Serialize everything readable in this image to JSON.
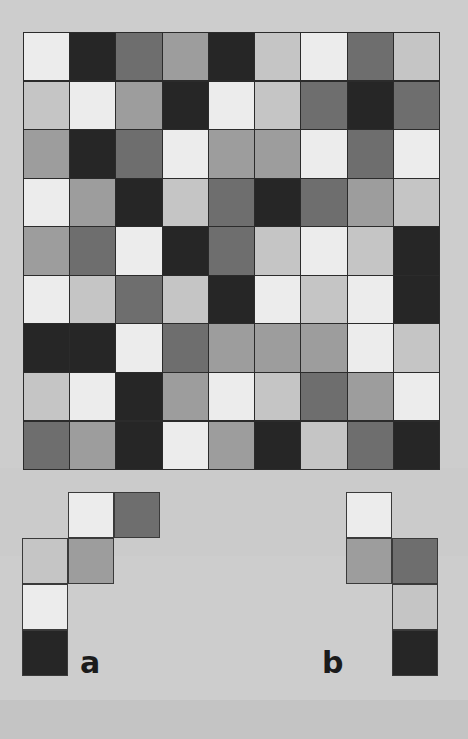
{
  "figure": {
    "background_color": "#cdcdcd",
    "border_color": "#2b2b2b"
  },
  "palette": {
    "very_light": "#ececec",
    "light": "#c5c5c5",
    "medium": "#9d9d9d",
    "medium_dark": "#6e6e6e",
    "very_dark": "#262626"
  },
  "grid": {
    "name": "main-grid",
    "rows": 9,
    "columns": 9,
    "cell_width_px": 46,
    "cell_height_px": 48,
    "cells": [
      [
        "very_light",
        "very_dark",
        "medium_dark",
        "medium",
        "very_dark",
        "light",
        "very_light",
        "medium_dark",
        "light"
      ],
      [
        "light",
        "very_light",
        "medium",
        "very_dark",
        "very_light",
        "light",
        "medium_dark",
        "very_dark",
        "medium_dark"
      ],
      [
        "medium",
        "very_dark",
        "medium_dark",
        "very_light",
        "medium",
        "medium",
        "very_light",
        "medium_dark",
        "very_light"
      ],
      [
        "very_light",
        "medium",
        "very_dark",
        "light",
        "medium_dark",
        "very_dark",
        "medium_dark",
        "medium",
        "light"
      ],
      [
        "medium",
        "medium_dark",
        "very_light",
        "very_dark",
        "medium_dark",
        "light",
        "very_light",
        "light",
        "very_dark"
      ],
      [
        "very_light",
        "light",
        "medium_dark",
        "light",
        "very_dark",
        "very_light",
        "light",
        "very_light",
        "very_dark"
      ],
      [
        "very_dark",
        "very_dark",
        "very_light",
        "medium_dark",
        "medium",
        "medium",
        "medium",
        "very_light",
        "light"
      ],
      [
        "light",
        "very_light",
        "very_dark",
        "medium",
        "very_light",
        "light",
        "medium_dark",
        "medium",
        "very_light"
      ],
      [
        "medium_dark",
        "medium",
        "very_dark",
        "very_light",
        "medium",
        "very_dark",
        "light",
        "medium_dark",
        "very_dark"
      ]
    ]
  },
  "pieces": [
    {
      "name": "piece-a",
      "label": "a",
      "rows": 4,
      "columns": 3,
      "cells": [
        [
          null,
          "very_light",
          "medium_dark"
        ],
        [
          "light",
          "medium",
          null
        ],
        [
          "very_light",
          null,
          null
        ],
        [
          "very_dark",
          null,
          null
        ]
      ]
    },
    {
      "name": "piece-b",
      "label": "b",
      "rows": 4,
      "columns": 2,
      "cells": [
        [
          "very_light",
          null
        ],
        [
          "medium",
          "medium_dark"
        ],
        [
          null,
          "light"
        ],
        [
          null,
          "very_dark"
        ]
      ]
    }
  ]
}
